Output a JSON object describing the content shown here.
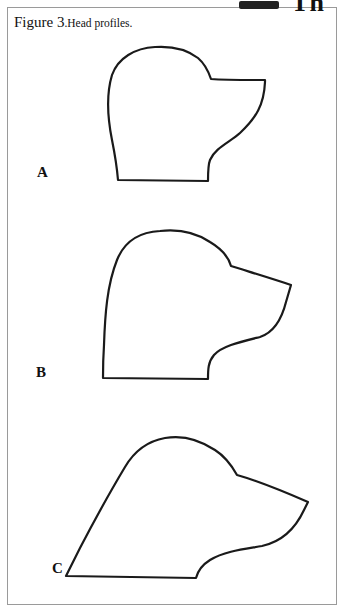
{
  "page": {
    "header_fragment": "Th",
    "caption": {
      "figure_label": "Figure 3",
      "text": ".Head profiles."
    }
  },
  "figure": {
    "title": "Head profiles",
    "panels": [
      {
        "label": "A",
        "description": "Head profile outline A"
      },
      {
        "label": "B",
        "description": "Head profile outline B"
      },
      {
        "label": "C",
        "description": "Head profile outline C"
      }
    ]
  },
  "colors": {
    "stroke": "#1a1a1a",
    "border": "#9a9a9a",
    "background": "#ffffff"
  }
}
